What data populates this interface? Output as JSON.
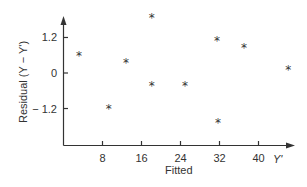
{
  "chart_data": {
    "type": "scatter",
    "title": "",
    "xlabel": "Fitted",
    "x_axis_end_label": "Y'",
    "ylabel": "Residual (Y − Y')",
    "xticks": [
      8,
      16,
      24,
      32,
      40
    ],
    "yticks": [
      1.2,
      0,
      -1.2
    ],
    "ytick_labels": [
      "1.2",
      "0",
      "− 1.2"
    ],
    "xlim": [
      0,
      47
    ],
    "ylim": [
      -2.4,
      2.0
    ],
    "grid": false,
    "marker": "*",
    "points": [
      {
        "x": 3.1,
        "y": 0.61
      },
      {
        "x": 9.2,
        "y": -1.18
      },
      {
        "x": 12.7,
        "y": 0.37
      },
      {
        "x": 18.0,
        "y": 1.89
      },
      {
        "x": 18.0,
        "y": -0.41
      },
      {
        "x": 24.8,
        "y": -0.41
      },
      {
        "x": 31.4,
        "y": 1.11
      },
      {
        "x": 31.6,
        "y": -1.66
      },
      {
        "x": 36.9,
        "y": 0.88
      },
      {
        "x": 46.0,
        "y": 0.14
      }
    ]
  },
  "colors": {
    "ink": "#333333",
    "background": "#ffffff"
  }
}
